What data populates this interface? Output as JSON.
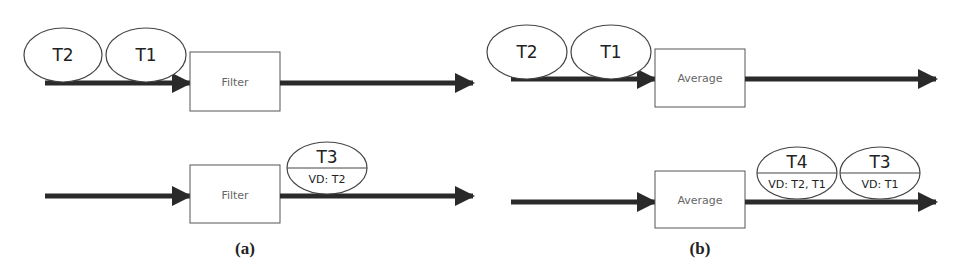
{
  "colors": {
    "arrow": "#2a2a2a",
    "box_stroke": "#555555",
    "ellipse_stroke": "#444444",
    "op_text": "#666666",
    "background": "#ffffff"
  },
  "panels": [
    {
      "label": "(a)",
      "operator": "Filter",
      "top_row": {
        "input_tokens": [
          {
            "name": "T2"
          },
          {
            "name": "T1"
          }
        ],
        "output_tokens": []
      },
      "bottom_row": {
        "input_tokens": [],
        "output_tokens": [
          {
            "name": "T3",
            "vd": "VD: T2"
          }
        ]
      }
    },
    {
      "label": "(b)",
      "operator": "Average",
      "top_row": {
        "input_tokens": [
          {
            "name": "T2"
          },
          {
            "name": "T1"
          }
        ],
        "output_tokens": []
      },
      "bottom_row": {
        "input_tokens": [],
        "output_tokens": [
          {
            "name": "T4",
            "vd": "VD: T2, T1"
          },
          {
            "name": "T3",
            "vd": "VD: T1"
          }
        ]
      }
    }
  ]
}
